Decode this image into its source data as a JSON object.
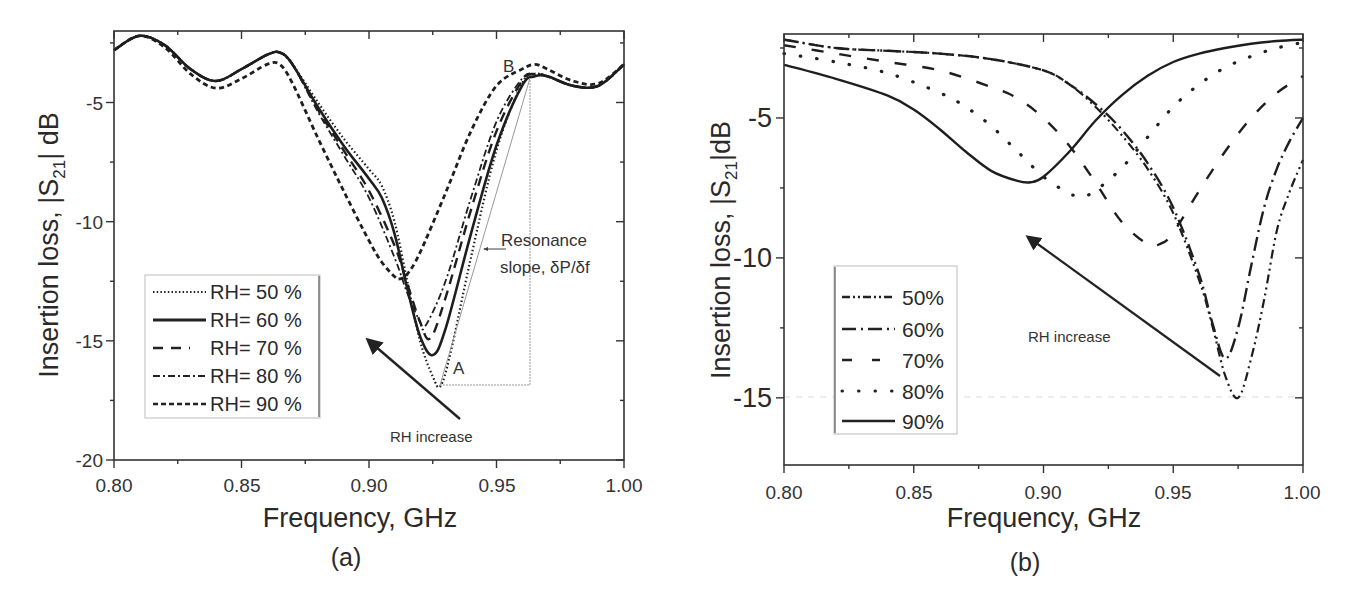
{
  "figure": {
    "panel_a": {
      "caption": "(a)",
      "xlabel": "Frequency, GHz",
      "ylabel_prefix": "Insertion loss, |S",
      "ylabel_sub": "21",
      "ylabel_suffix": "| dB",
      "x_ticks": [
        "0.80",
        "0.85",
        "0.90",
        "0.95",
        "1.00"
      ],
      "y_ticks": [
        "-5",
        "-10",
        "-15",
        "-20"
      ],
      "annotations": {
        "point_a": "A",
        "point_b": "B",
        "slope_line1": "Resonance",
        "slope_line2": "slope, δP/δf",
        "arrow_label": "RH increase"
      },
      "legend": [
        "RH= 50 %",
        "RH= 60 %",
        "RH= 70 %",
        "RH= 80 %",
        "RH= 90 %"
      ]
    },
    "panel_b": {
      "caption": "(b)",
      "xlabel": "Frequency, GHz",
      "ylabel_prefix": "Insertion loss, |S",
      "ylabel_sub": "21",
      "ylabel_suffix": "|dB",
      "x_ticks": [
        "0.80",
        "0.85",
        "0.90",
        "0.95",
        "1.00"
      ],
      "y_ticks": [
        "-5",
        "-10",
        "-15"
      ],
      "annotations": {
        "arrow_label": "RH increase"
      },
      "legend": [
        "50%",
        "60%",
        "70%",
        "80%",
        "90%"
      ]
    }
  },
  "chart_data": [
    {
      "type": "line",
      "title": "(a)",
      "xlabel": "Frequency, GHz",
      "ylabel": "Insertion loss, |S21| dB",
      "xlim": [
        0.8,
        1.0
      ],
      "ylim": [
        -20,
        -2
      ],
      "x_ticks": [
        0.8,
        0.85,
        0.9,
        0.95,
        1.0
      ],
      "y_ticks": [
        -5,
        -10,
        -15,
        -20
      ],
      "grid": false,
      "legend_position": "lower left",
      "annotations": [
        {
          "text": "A",
          "x": 0.929,
          "y": -16.3
        },
        {
          "text": "B",
          "x": 0.956,
          "y": -3.0
        },
        {
          "text": "Resonance slope, δP/δf",
          "x": 0.965,
          "y": -11.5
        },
        {
          "text": "RH increase",
          "x": 0.93,
          "y": -18.0,
          "arrow_from": [
            0.937,
            -17.5
          ],
          "arrow_to": [
            0.897,
            -15.3
          ]
        }
      ],
      "slope_triangle": {
        "A": [
          0.927,
          -16.9
        ],
        "B": [
          0.963,
          -3.9
        ],
        "corner": [
          0.963,
          -16.9
        ]
      },
      "series": [
        {
          "name": "RH= 50 %",
          "dash": "dotted",
          "x": [
            0.8,
            0.81,
            0.82,
            0.83,
            0.84,
            0.85,
            0.86,
            0.865,
            0.87,
            0.88,
            0.89,
            0.9,
            0.905,
            0.91,
            0.915,
            0.92,
            0.925,
            0.928,
            0.932,
            0.94,
            0.95,
            0.96,
            0.965,
            0.97,
            0.98,
            0.99,
            1.0
          ],
          "y": [
            -2.8,
            -2.2,
            -2.6,
            -3.6,
            -4.1,
            -3.6,
            -3.0,
            -2.9,
            -3.4,
            -5.0,
            -6.5,
            -7.8,
            -8.5,
            -10.0,
            -12.5,
            -15.0,
            -16.5,
            -16.9,
            -15.5,
            -11.5,
            -7.0,
            -4.2,
            -3.8,
            -3.9,
            -4.3,
            -4.3,
            -3.4
          ]
        },
        {
          "name": "RH= 60 %",
          "dash": "solid",
          "x": [
            0.8,
            0.81,
            0.82,
            0.83,
            0.84,
            0.85,
            0.86,
            0.865,
            0.87,
            0.88,
            0.89,
            0.9,
            0.905,
            0.91,
            0.915,
            0.92,
            0.925,
            0.93,
            0.94,
            0.95,
            0.96,
            0.965,
            0.97,
            0.98,
            0.99,
            1.0
          ],
          "y": [
            -2.8,
            -2.2,
            -2.6,
            -3.6,
            -4.1,
            -3.6,
            -3.0,
            -2.9,
            -3.4,
            -5.2,
            -6.8,
            -8.2,
            -9.0,
            -10.5,
            -12.8,
            -14.8,
            -15.6,
            -14.5,
            -10.5,
            -6.8,
            -4.3,
            -3.9,
            -3.9,
            -4.3,
            -4.3,
            -3.4
          ]
        },
        {
          "name": "RH= 70 %",
          "dash": "long-dash",
          "x": [
            0.8,
            0.81,
            0.82,
            0.83,
            0.84,
            0.85,
            0.86,
            0.865,
            0.87,
            0.88,
            0.89,
            0.9,
            0.91,
            0.915,
            0.92,
            0.924,
            0.93,
            0.94,
            0.95,
            0.96,
            0.965,
            0.97,
            0.98,
            0.99,
            1.0
          ],
          "y": [
            -2.8,
            -2.2,
            -2.6,
            -3.6,
            -4.1,
            -3.6,
            -3.0,
            -2.9,
            -3.4,
            -5.3,
            -7.0,
            -8.7,
            -11.0,
            -12.6,
            -14.2,
            -14.9,
            -13.2,
            -9.5,
            -6.2,
            -4.1,
            -3.8,
            -3.9,
            -4.3,
            -4.3,
            -3.4
          ]
        },
        {
          "name": "RH= 80 %",
          "dash": "dash-dot",
          "x": [
            0.8,
            0.81,
            0.82,
            0.83,
            0.84,
            0.85,
            0.86,
            0.865,
            0.87,
            0.88,
            0.89,
            0.9,
            0.91,
            0.915,
            0.92,
            0.922,
            0.93,
            0.94,
            0.95,
            0.96,
            0.965,
            0.97,
            0.98,
            0.99,
            1.0
          ],
          "y": [
            -2.8,
            -2.2,
            -2.6,
            -3.6,
            -4.1,
            -3.6,
            -3.0,
            -2.9,
            -3.4,
            -5.4,
            -7.2,
            -9.0,
            -11.5,
            -13.0,
            -14.2,
            -14.4,
            -12.5,
            -9.0,
            -5.8,
            -4.0,
            -3.8,
            -3.9,
            -4.3,
            -4.3,
            -3.4
          ]
        },
        {
          "name": "RH= 90 %",
          "dash": "short-dash",
          "x": [
            0.8,
            0.81,
            0.82,
            0.83,
            0.84,
            0.85,
            0.86,
            0.865,
            0.87,
            0.88,
            0.89,
            0.9,
            0.905,
            0.91,
            0.912,
            0.915,
            0.92,
            0.93,
            0.94,
            0.95,
            0.96,
            0.965,
            0.97,
            0.98,
            0.99,
            1.0
          ],
          "y": [
            -2.8,
            -2.2,
            -2.7,
            -3.8,
            -4.4,
            -4.0,
            -3.4,
            -3.4,
            -4.2,
            -6.5,
            -8.7,
            -10.8,
            -11.7,
            -12.3,
            -12.4,
            -12.2,
            -11.3,
            -8.8,
            -6.2,
            -4.3,
            -3.6,
            -3.4,
            -3.6,
            -4.1,
            -4.2,
            -3.4
          ]
        }
      ]
    },
    {
      "type": "line",
      "title": "(b)",
      "xlabel": "Frequency, GHz",
      "ylabel": "Insertion loss, |S21|dB",
      "xlim": [
        0.8,
        1.0
      ],
      "ylim": [
        -17.4,
        -2
      ],
      "x_ticks": [
        0.8,
        0.85,
        0.9,
        0.95,
        1.0
      ],
      "y_ticks": [
        -5,
        -10,
        -15
      ],
      "grid": false,
      "legend_position": "lower left",
      "annotations": [
        {
          "text": "RH increase",
          "x": 0.86,
          "y": -12.8,
          "arrow_from": [
            0.966,
            -14.3
          ],
          "arrow_to": [
            0.894,
            -9.2
          ]
        }
      ],
      "series": [
        {
          "name": "50%",
          "dash": "dash-dot-dot",
          "x": [
            0.8,
            0.82,
            0.84,
            0.86,
            0.88,
            0.9,
            0.91,
            0.92,
            0.93,
            0.94,
            0.95,
            0.96,
            0.965,
            0.97,
            0.975,
            0.98,
            0.985,
            0.99,
            0.995,
            1.0
          ],
          "y": [
            -2.2,
            -2.5,
            -2.6,
            -2.7,
            -2.9,
            -3.3,
            -3.8,
            -4.6,
            -5.6,
            -6.8,
            -8.4,
            -10.8,
            -12.4,
            -14.2,
            -15.0,
            -13.6,
            -11.5,
            -9.0,
            -7.6,
            -6.5
          ]
        },
        {
          "name": "60%",
          "dash": "dash-dot",
          "x": [
            0.8,
            0.82,
            0.84,
            0.86,
            0.88,
            0.9,
            0.91,
            0.92,
            0.93,
            0.94,
            0.95,
            0.96,
            0.965,
            0.97,
            0.975,
            0.98,
            0.985,
            0.99,
            0.995,
            1.0
          ],
          "y": [
            -2.2,
            -2.5,
            -2.6,
            -2.7,
            -2.9,
            -3.3,
            -3.8,
            -4.5,
            -5.4,
            -6.6,
            -8.2,
            -10.6,
            -12.3,
            -13.6,
            -12.5,
            -10.3,
            -8.2,
            -6.8,
            -5.8,
            -5.0
          ]
        },
        {
          "name": "70%",
          "dash": "long-dash",
          "x": [
            0.8,
            0.82,
            0.84,
            0.86,
            0.88,
            0.89,
            0.9,
            0.91,
            0.92,
            0.93,
            0.94,
            0.945,
            0.95,
            0.96,
            0.97,
            0.98,
            0.99,
            1.0
          ],
          "y": [
            -2.4,
            -2.7,
            -3.0,
            -3.3,
            -3.9,
            -4.3,
            -5.0,
            -6.0,
            -7.3,
            -8.7,
            -9.5,
            -9.5,
            -9.1,
            -7.6,
            -6.2,
            -5.0,
            -4.1,
            -3.5
          ]
        },
        {
          "name": "80%",
          "dash": "dotted",
          "x": [
            0.8,
            0.82,
            0.84,
            0.86,
            0.87,
            0.88,
            0.89,
            0.9,
            0.91,
            0.915,
            0.92,
            0.93,
            0.94,
            0.95,
            0.96,
            0.97,
            0.98,
            0.99,
            1.0
          ],
          "y": [
            -2.7,
            -3.0,
            -3.4,
            -4.1,
            -4.6,
            -5.3,
            -6.2,
            -7.1,
            -7.7,
            -7.8,
            -7.6,
            -6.8,
            -5.7,
            -4.6,
            -3.8,
            -3.2,
            -2.8,
            -2.5,
            -2.3
          ]
        },
        {
          "name": "90%",
          "dash": "solid",
          "x": [
            0.8,
            0.82,
            0.84,
            0.85,
            0.86,
            0.87,
            0.88,
            0.89,
            0.895,
            0.9,
            0.91,
            0.92,
            0.93,
            0.94,
            0.95,
            0.96,
            0.97,
            0.98,
            0.99,
            1.0
          ],
          "y": [
            -3.1,
            -3.6,
            -4.2,
            -4.7,
            -5.4,
            -6.2,
            -6.9,
            -7.25,
            -7.3,
            -7.1,
            -6.2,
            -5.1,
            -4.2,
            -3.5,
            -3.0,
            -2.7,
            -2.5,
            -2.35,
            -2.25,
            -2.2
          ]
        }
      ]
    }
  ]
}
